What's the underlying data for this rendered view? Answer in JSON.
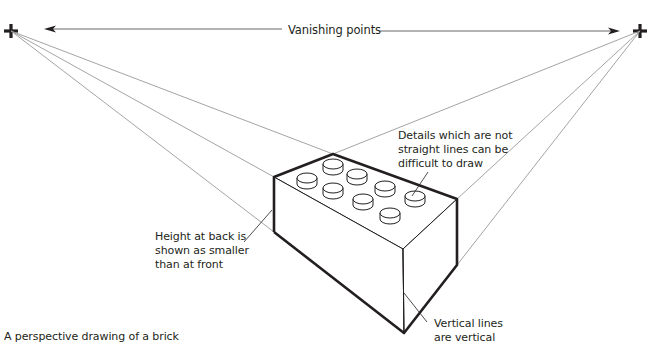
{
  "diagram": {
    "title": "A perspective drawing of a brick",
    "vanishing_points_label": "Vanishing points",
    "annotations": {
      "details": "Details which are not\nstraight lines can be\ndifficult to draw",
      "height": "Height at back is\nshown as smaller\nthan at front",
      "vertical": "Vertical lines\nare vertical"
    },
    "vanishing_points": [
      {
        "name": "left",
        "x": 11,
        "y": 31
      },
      {
        "name": "right",
        "x": 640,
        "y": 31
      }
    ],
    "colors": {
      "ink": "#231f20",
      "construction_line": "#9a9a9a",
      "background": "#ffffff"
    }
  }
}
